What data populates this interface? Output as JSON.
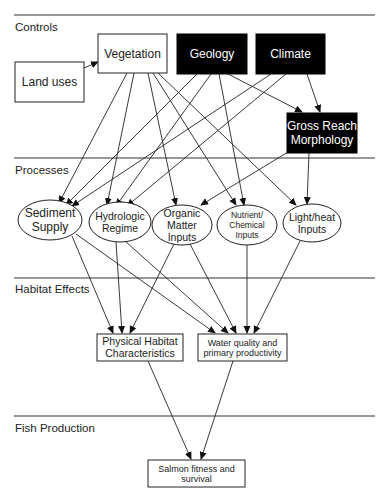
{
  "sections": [
    {
      "id": "controls",
      "label": "Controls",
      "line_y": 15,
      "label_y": 31
    },
    {
      "id": "processes",
      "label": "Processes",
      "line_y": 158,
      "label_y": 174
    },
    {
      "id": "habitat",
      "label": "Habitat Effects",
      "line_y": 278,
      "label_y": 293
    },
    {
      "id": "fish",
      "label": "Fish Production",
      "line_y": 416,
      "label_y": 432
    }
  ],
  "nodes": {
    "land_uses": {
      "label": [
        "Land uses"
      ],
      "shape": "box",
      "style": "light",
      "x": 15,
      "y": 62,
      "w": 69,
      "h": 40,
      "font": 12
    },
    "vegetation": {
      "label": [
        "Vegetation"
      ],
      "shape": "box",
      "style": "light",
      "x": 98,
      "y": 34,
      "w": 69,
      "h": 39,
      "font": 12
    },
    "geology": {
      "label": [
        "Geology"
      ],
      "shape": "box",
      "style": "dark",
      "x": 177,
      "y": 34,
      "w": 70,
      "h": 40,
      "font": 12
    },
    "climate": {
      "label": [
        "Climate"
      ],
      "shape": "box",
      "style": "dark",
      "x": 256,
      "y": 34,
      "w": 69,
      "h": 40,
      "font": 12
    },
    "gross_reach": {
      "label": [
        "Gross Reach",
        "Morphology"
      ],
      "shape": "box",
      "style": "dark",
      "x": 287,
      "y": 113,
      "w": 70,
      "h": 40,
      "font": 12
    },
    "sediment": {
      "label": [
        "Sediment",
        "Supply"
      ],
      "shape": "ellipse",
      "cx": 50,
      "cy": 220,
      "rx": 32,
      "ry": 20,
      "font": 12
    },
    "hydrologic": {
      "label": [
        "Hydrologic",
        "Regime"
      ],
      "shape": "ellipse",
      "cx": 120,
      "cy": 222,
      "rx": 31,
      "ry": 20,
      "font": 10.5
    },
    "organic": {
      "label": [
        "Organic",
        "Matter",
        "Inputs"
      ],
      "shape": "ellipse",
      "cx": 182,
      "cy": 225,
      "rx": 30,
      "ry": 20,
      "font": 10.5
    },
    "nutrient": {
      "label": [
        "Nutrient/",
        "Chemical",
        "Inputs"
      ],
      "shape": "ellipse",
      "cx": 247,
      "cy": 225,
      "rx": 30,
      "ry": 20,
      "font": 8.5
    },
    "light": {
      "label": [
        "Light/heat",
        "Inputs"
      ],
      "shape": "ellipse",
      "cx": 312,
      "cy": 223,
      "rx": 29,
      "ry": 19,
      "font": 10.5
    },
    "physical_habitat": {
      "label": [
        "Physical Habitat",
        "Characteristics"
      ],
      "shape": "box",
      "style": "light",
      "x": 97,
      "y": 334,
      "w": 86,
      "h": 27,
      "font": 10.5
    },
    "water_quality": {
      "label": [
        "Water quality and",
        "primary productivity"
      ],
      "shape": "box",
      "style": "light",
      "x": 198,
      "y": 334,
      "w": 89,
      "h": 27,
      "font": 9
    },
    "salmon": {
      "label": [
        "Salmon fitness and",
        "survival"
      ],
      "shape": "box",
      "style": "light",
      "x": 148,
      "y": 460,
      "w": 97,
      "h": 27,
      "font": 9
    }
  },
  "edges": [
    {
      "from": "land_uses",
      "to": "vegetation",
      "x1": 84,
      "y1": 68,
      "x2": 98,
      "y2": 62
    },
    {
      "from": "vegetation",
      "to": "sediment",
      "x1": 127,
      "y1": 73,
      "x2": 59,
      "y2": 203
    },
    {
      "from": "vegetation",
      "to": "hydrologic",
      "x1": 134,
      "y1": 73,
      "x2": 107,
      "y2": 205
    },
    {
      "from": "vegetation",
      "to": "organic",
      "x1": 148,
      "y1": 73,
      "x2": 176,
      "y2": 205
    },
    {
      "from": "vegetation",
      "to": "nutrient",
      "x1": 153,
      "y1": 73,
      "x2": 236,
      "y2": 205
    },
    {
      "from": "vegetation",
      "to": "light",
      "x1": 158,
      "y1": 73,
      "x2": 296,
      "y2": 205
    },
    {
      "from": "geology",
      "to": "sediment",
      "x1": 197,
      "y1": 74,
      "x2": 66,
      "y2": 205
    },
    {
      "from": "geology",
      "to": "hydrologic",
      "x1": 211,
      "y1": 74,
      "x2": 116,
      "y2": 206
    },
    {
      "from": "geology",
      "to": "nutrient",
      "x1": 219,
      "y1": 74,
      "x2": 244,
      "y2": 205
    },
    {
      "from": "geology",
      "to": "gross_reach",
      "x1": 228,
      "y1": 74,
      "x2": 302,
      "y2": 112
    },
    {
      "from": "climate",
      "to": "sediment",
      "x1": 271,
      "y1": 74,
      "x2": 72,
      "y2": 206
    },
    {
      "from": "climate",
      "to": "hydrologic",
      "x1": 286,
      "y1": 74,
      "x2": 127,
      "y2": 206
    },
    {
      "from": "climate",
      "to": "gross_reach",
      "x1": 307,
      "y1": 74,
      "x2": 320,
      "y2": 112
    },
    {
      "from": "gross_reach",
      "to": "organic",
      "x1": 288,
      "y1": 152,
      "x2": 201,
      "y2": 205
    },
    {
      "from": "gross_reach",
      "to": "light",
      "x1": 309,
      "y1": 153,
      "x2": 307,
      "y2": 204
    },
    {
      "from": "sediment",
      "to": "physical_habitat",
      "x1": 72,
      "y1": 236,
      "x2": 113,
      "y2": 333
    },
    {
      "from": "sediment",
      "to": "water_quality",
      "x1": 76,
      "y1": 234,
      "x2": 215,
      "y2": 333
    },
    {
      "from": "hydrologic",
      "to": "physical_habitat",
      "x1": 116,
      "y1": 242,
      "x2": 122,
      "y2": 333
    },
    {
      "from": "hydrologic",
      "to": "water_quality",
      "x1": 125,
      "y1": 241,
      "x2": 228,
      "y2": 333
    },
    {
      "from": "organic",
      "to": "physical_habitat",
      "x1": 174,
      "y1": 244,
      "x2": 130,
      "y2": 333
    },
    {
      "from": "organic",
      "to": "water_quality",
      "x1": 190,
      "y1": 244,
      "x2": 236,
      "y2": 333
    },
    {
      "from": "nutrient",
      "to": "water_quality",
      "x1": 247,
      "y1": 245,
      "x2": 247,
      "y2": 333
    },
    {
      "from": "light",
      "to": "water_quality",
      "x1": 300,
      "y1": 241,
      "x2": 254,
      "y2": 333
    },
    {
      "from": "physical_habitat",
      "to": "salmon",
      "x1": 148,
      "y1": 361,
      "x2": 191,
      "y2": 459
    },
    {
      "from": "water_quality",
      "to": "salmon",
      "x1": 233,
      "y1": 361,
      "x2": 201,
      "y2": 459
    }
  ]
}
